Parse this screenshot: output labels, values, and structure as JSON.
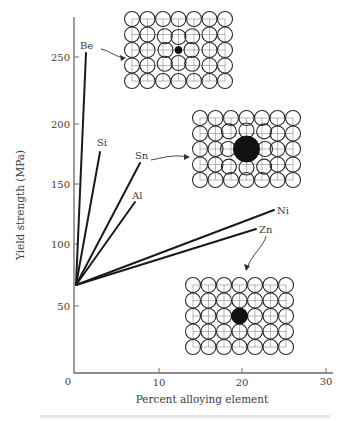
{
  "chart_data": {
    "type": "line",
    "title": "",
    "xlabel": "Percent alloying element",
    "ylabel": "Yield strength (MPa)",
    "xlim": [
      0,
      30
    ],
    "ylim": [
      0,
      270
    ],
    "x_ticks": [
      0,
      10,
      20,
      30
    ],
    "y_ticks": [
      50,
      100,
      150,
      200,
      250
    ],
    "grid": false,
    "legend": "none (series labeled directly at line ends)",
    "series": [
      {
        "name": "Be",
        "x": [
          0,
          1.4
        ],
        "y": [
          68,
          255
        ]
      },
      {
        "name": "Si",
        "x": [
          0,
          3.1
        ],
        "y": [
          68,
          176
        ]
      },
      {
        "name": "Sn",
        "x": [
          0,
          7.9
        ],
        "y": [
          68,
          167
        ]
      },
      {
        "name": "Al",
        "x": [
          0,
          7.3
        ],
        "y": [
          68,
          135
        ]
      },
      {
        "name": "Ni",
        "x": [
          0,
          23.9
        ],
        "y": [
          68,
          129
        ]
      },
      {
        "name": "Zn",
        "x": [
          0,
          21.8
        ],
        "y": [
          68,
          113
        ]
      }
    ],
    "annotations": [
      {
        "type": "lattice-inset",
        "points_to": "Be",
        "description": "7x5 atom lattice with small substitutional solute atom (black) at center, lattice distorted"
      },
      {
        "type": "lattice-inset",
        "points_to": "Sn",
        "description": "7x5 atom lattice with large substitutional solute atom (black) at center, lattice distorted"
      },
      {
        "type": "lattice-inset",
        "points_to": "Zn",
        "description": "7x5 atom lattice with near-same-size solute atom (black) at center, little distortion"
      }
    ]
  },
  "axes": {
    "x_title": "Percent alloying element",
    "y_title": "Yield strength (MPa)",
    "x_tick_labels": [
      "0",
      "10",
      "20",
      "30"
    ],
    "y_tick_labels": [
      "50",
      "100",
      "150",
      "200",
      "250"
    ]
  },
  "labels": {
    "be": "Be",
    "si": "Si",
    "sn": "Sn",
    "al": "Al",
    "ni": "Ni",
    "zn": "Zn"
  },
  "colors": {
    "line": "#1a1a1a",
    "axis": "#555555",
    "atom_outline": "#2a2a2a",
    "solute": "#111111"
  }
}
